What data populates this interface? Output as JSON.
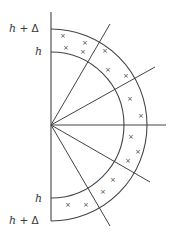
{
  "figure": {
    "type": "half-annulus cross-section diagram",
    "stroke_color": "#444444",
    "background": "#ffffff",
    "labels": {
      "top_outer": {
        "var": "h",
        "rest": " + Δ"
      },
      "top_inner": {
        "var": "h",
        "rest": ""
      },
      "bottom_inner": {
        "var": "h",
        "rest": ""
      },
      "bottom_outer": {
        "var": "h",
        "rest": " + Δ"
      }
    },
    "marker_glyph": "×",
    "geometry": {
      "center": [
        51,
        125
      ],
      "inner_radius": 73,
      "outer_radius": 96,
      "axis_top": 12,
      "axis_bottom": 221,
      "radial_lines": [
        {
          "name": "radial-line-upper",
          "end": [
            110,
            24
          ]
        },
        {
          "name": "radial-line-upper-right",
          "end": [
            155,
            67
          ]
        },
        {
          "name": "radial-line-horizontal",
          "end": [
            166,
            125
          ]
        },
        {
          "name": "radial-line-lower-right",
          "end": [
            150,
            182
          ]
        },
        {
          "name": "radial-line-lower",
          "end": [
            110,
            226
          ]
        }
      ],
      "markers": [
        [
          63,
          36
        ],
        [
          85,
          43
        ],
        [
          66,
          48
        ],
        [
          83,
          52
        ],
        [
          105,
          51
        ],
        [
          108,
          70
        ],
        [
          126,
          76
        ],
        [
          130,
          99
        ],
        [
          141,
          116
        ],
        [
          131,
          137
        ],
        [
          138,
          152
        ],
        [
          128,
          161
        ],
        [
          113,
          180
        ],
        [
          103,
          192
        ],
        [
          86,
          205
        ],
        [
          68,
          205
        ]
      ]
    }
  }
}
